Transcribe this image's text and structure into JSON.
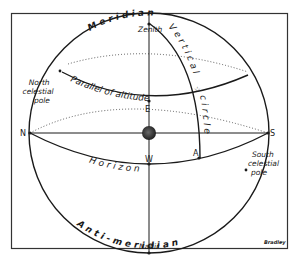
{
  "diagram": {
    "type": "celestial-sphere",
    "credit": "Bradley",
    "colors": {
      "ink": "#1a1a1a",
      "background": "#ffffff",
      "frame": "#333333"
    },
    "curve_labels": {
      "meridian": "M e r i d i a n",
      "anti_meridian": "A n t i - m e r i d i a n",
      "parallel_of_altitude": "Parallel of altitude",
      "vertical_circle_top": "V e r t i c a l",
      "vertical_circle_bottom": "c i r c l e",
      "horizon": "H o r i z o n"
    },
    "point_labels": {
      "zenith": "Zenith",
      "nadir": "Nadir",
      "north": "N",
      "south": "S",
      "east": "E",
      "west": "W",
      "star_point": "A",
      "star_symbol": "☆"
    },
    "pole_labels": {
      "north_celestial_pole": [
        "North",
        "celestial",
        "pole"
      ],
      "south_celestial_pole": [
        "South",
        "celestial",
        "pole"
      ]
    },
    "center_object": "earth"
  }
}
